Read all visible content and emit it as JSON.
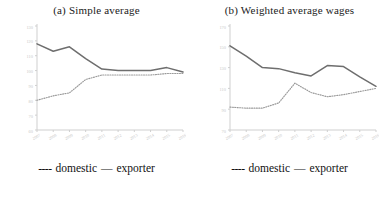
{
  "figure": {
    "legend_dotted_marker": "----",
    "legend_dotted_label": "domestic",
    "legend_solid_marker": "—",
    "legend_solid_label": "exporter",
    "series_colors": {
      "domestic": "#9a9a9a",
      "exporter": "#6e6e6e",
      "axis": "#cfcfcf",
      "tick_text": "#c9c9c9"
    }
  },
  "chart_data": [
    {
      "type": "line",
      "title": "(a)   Simple average",
      "xlabel": "",
      "ylabel": "",
      "x": [
        "2007",
        "2008",
        "2009",
        "2010",
        "2011",
        "2012",
        "2013",
        "2014",
        "2015",
        "2016"
      ],
      "ylim": [
        60,
        130
      ],
      "yticks": [
        130,
        120,
        110,
        100,
        90,
        80,
        70,
        60
      ],
      "grid": false,
      "legend_position": "below",
      "series": [
        {
          "name": "exporter",
          "style": "solid",
          "values": [
            118,
            113,
            116,
            108,
            101,
            100,
            100,
            100,
            102,
            99
          ]
        },
        {
          "name": "domestic",
          "style": "dotted",
          "values": [
            80,
            83,
            85,
            94,
            97,
            97,
            97,
            97,
            98,
            98
          ]
        }
      ]
    },
    {
      "type": "line",
      "title": "(b) Weighted average wages",
      "xlabel": "",
      "ylabel": "",
      "x": [
        "2007",
        "2008",
        "2009",
        "2010",
        "2011",
        "2012",
        "2013",
        "2014",
        "2015",
        "2016"
      ],
      "ylim": [
        70,
        170
      ],
      "yticks": [
        170,
        150,
        130,
        110,
        90,
        70
      ],
      "grid": false,
      "legend_position": "below",
      "series": [
        {
          "name": "exporter",
          "style": "solid",
          "values": [
            151,
            141,
            130,
            129,
            125,
            122,
            132,
            131,
            121,
            112
          ]
        },
        {
          "name": "domestic",
          "style": "dotted",
          "values": [
            92,
            91,
            91,
            96,
            115,
            106,
            102,
            104,
            107,
            110
          ]
        }
      ]
    }
  ]
}
